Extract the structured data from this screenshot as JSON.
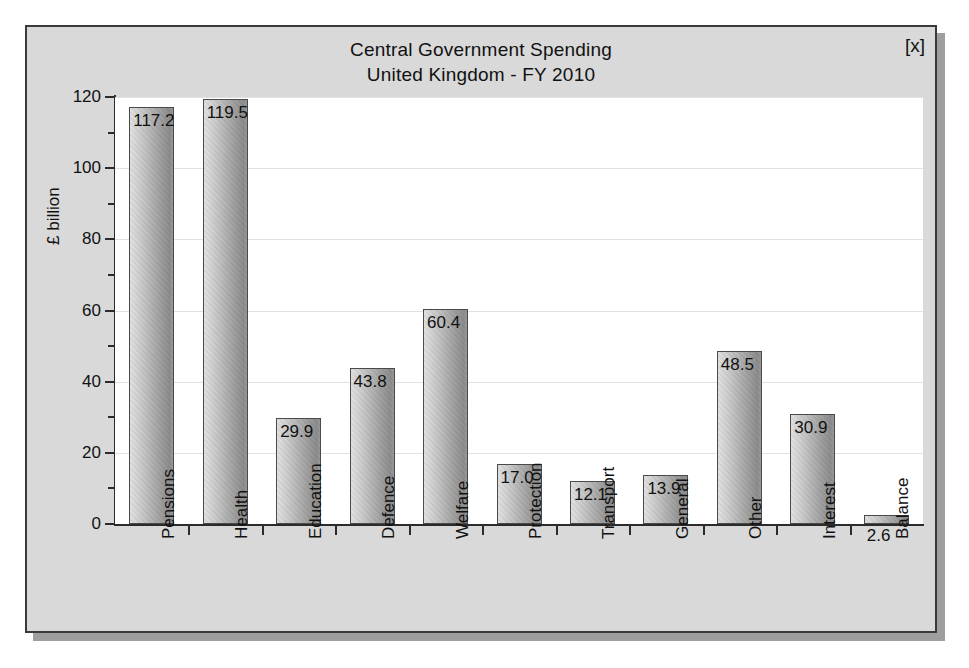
{
  "window": {
    "close_label": "[x]"
  },
  "chart_data": {
    "type": "bar",
    "title": "Central Government Spending",
    "subtitle": "United Kingdom - FY 2010",
    "xlabel": "",
    "ylabel": "£ billion",
    "ylim": [
      0,
      120
    ],
    "ytick_step": 20,
    "yminor_step": 10,
    "grid": true,
    "legend": false,
    "ytick_labels": [
      "0",
      "20",
      "40",
      "60",
      "80",
      "100",
      "120"
    ],
    "categories": [
      "Pensions",
      "Health",
      "Education",
      "Defence",
      "Welfare",
      "Protection",
      "Transport",
      "General",
      "Other",
      "Interest",
      "Balance"
    ],
    "values": [
      117.2,
      119.5,
      29.9,
      43.8,
      60.4,
      17.0,
      12.1,
      13.9,
      48.5,
      30.9,
      2.6
    ],
    "value_labels": [
      "117.2",
      "119.5",
      "29.9",
      "43.8",
      "60.4",
      "17.0",
      "12.1",
      "13.9",
      "48.5",
      "30.9",
      "2.6"
    ]
  },
  "colors": {
    "panel_background": "#d9d9d9",
    "plot_background": "#ffffff",
    "axis": "#2b2b2b",
    "gridline": "#e2e2e2",
    "bar_light": "#e2e2e2",
    "bar_dark": "#8d8d8d",
    "bar_border": "#4a4a4a",
    "text": "#111111",
    "shadow": "#9e9e9e"
  }
}
